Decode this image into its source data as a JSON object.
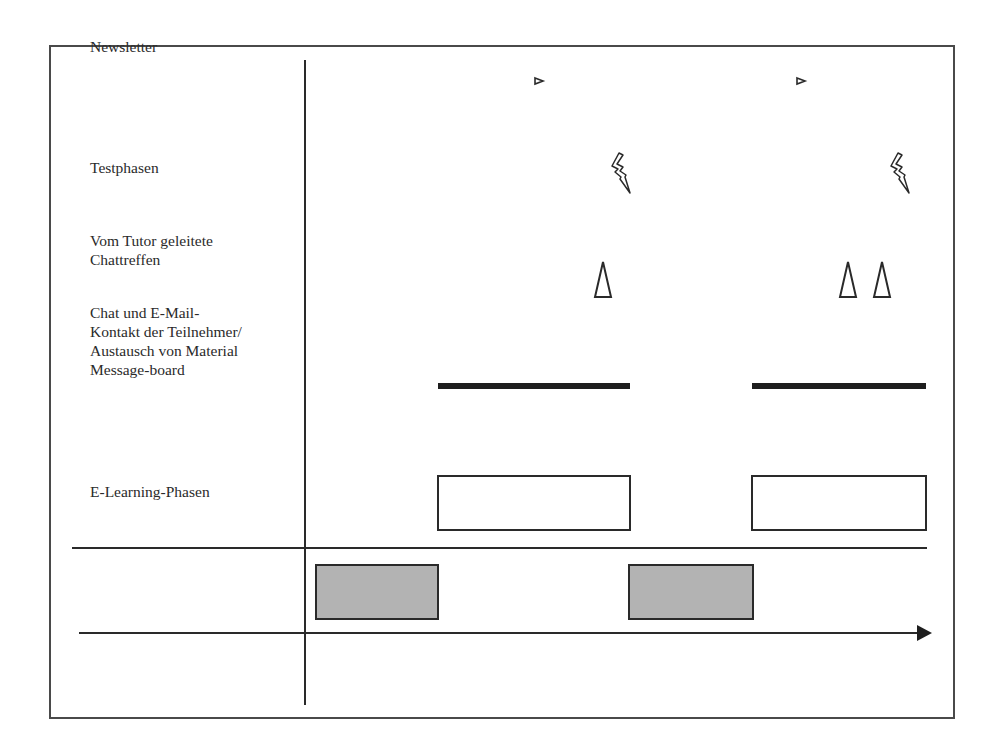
{
  "diagram": {
    "rows": [
      {
        "id": "newsletter",
        "label": "Newsletter"
      },
      {
        "id": "testphasen",
        "label": "Testphasen"
      },
      {
        "id": "chattreffen",
        "label": "Vom Tutor geleitete\nChattreffen"
      },
      {
        "id": "kontakt",
        "label": "Chat und E-Mail-\nKontakt der Teilnehmer/\nAustausch von Material\nMessage-board"
      },
      {
        "id": "elearning",
        "label": "E-Learning-Phasen"
      }
    ],
    "symbols": {
      "newsletter": "small-triangle-marker",
      "testphasen": "lightning-bolt",
      "chattreffen": "tall-triangle",
      "kontakt": "thick-bar",
      "elearning": "white-rectangle",
      "presence": "gray-rectangle",
      "timeline": "arrow"
    },
    "colors": {
      "line": "#2a2a2a",
      "presence_fill": "#b3b3b3",
      "border": "#4a4a4a"
    }
  }
}
